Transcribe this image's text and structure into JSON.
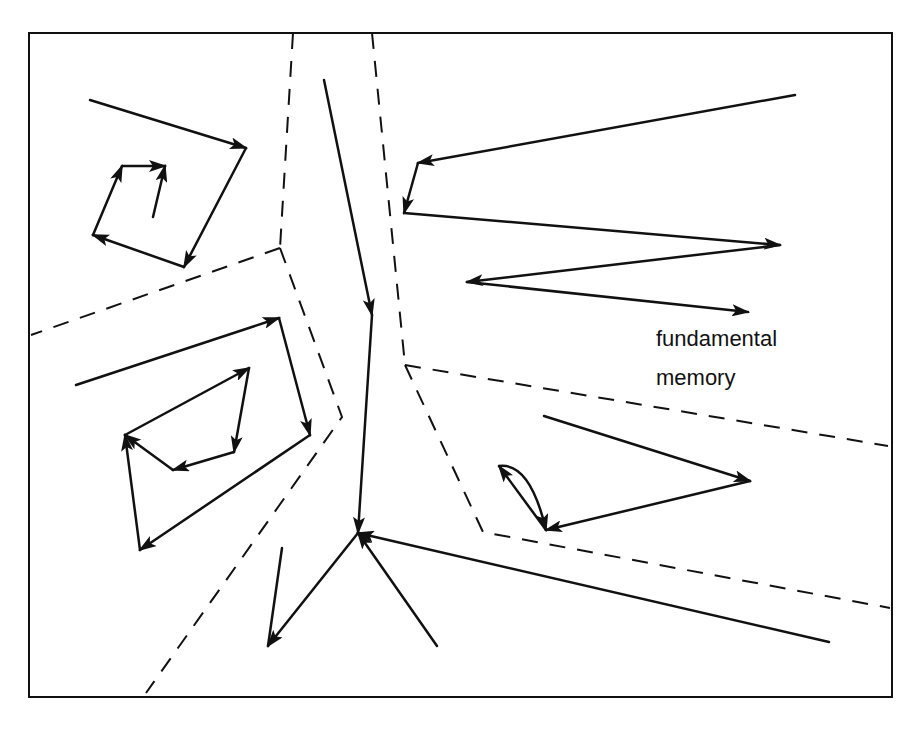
{
  "diagram": {
    "colors": {
      "ink": "#111111",
      "background": "#ffffff"
    },
    "frame": {
      "x1": 29,
      "y1": 33,
      "x2": 892,
      "y2": 697
    },
    "labels": [
      {
        "id": "label-fundamental",
        "text": "fundamental",
        "x": 656,
        "y": 326
      },
      {
        "id": "label-memory",
        "text": "memory",
        "x": 656,
        "y": 365
      }
    ],
    "basin_boundaries": [
      {
        "id": "boundary-left-vertical",
        "points": [
          [
            293,
            33
          ],
          [
            280,
            248
          ]
        ]
      },
      {
        "id": "boundary-left-upper-diagonal",
        "points": [
          [
            280,
            248
          ],
          [
            31,
            335
          ]
        ]
      },
      {
        "id": "boundary-left-lower",
        "points": [
          [
            280,
            248
          ],
          [
            342,
            417
          ],
          [
            146,
            693
          ]
        ]
      },
      {
        "id": "boundary-center-vertical",
        "points": [
          [
            372,
            33
          ],
          [
            405,
            365
          ]
        ]
      },
      {
        "id": "boundary-right-upper",
        "points": [
          [
            405,
            365
          ],
          [
            888,
            446
          ]
        ]
      },
      {
        "id": "boundary-right-lower",
        "points": [
          [
            405,
            365
          ],
          [
            483,
            532
          ],
          [
            890,
            608
          ]
        ]
      }
    ],
    "trajectories": [
      {
        "id": "spiral-outer",
        "points": [
          [
            90,
            100
          ],
          [
            246,
            148
          ],
          [
            184,
            267
          ],
          [
            93,
            235
          ],
          [
            122,
            166
          ],
          [
            165,
            166
          ]
        ],
        "arrows_at": [
          1,
          2,
          3,
          4,
          5
        ]
      },
      {
        "id": "spiral-inner",
        "points": [
          [
            153,
            217
          ],
          [
            165,
            166
          ]
        ],
        "arrows_at": [
          1
        ]
      },
      {
        "id": "loop-outer",
        "points": [
          [
            76,
            385
          ],
          [
            279,
            318
          ],
          [
            310,
            435
          ],
          [
            140,
            550
          ],
          [
            125,
            435
          ]
        ],
        "arrows_at": [
          1,
          2,
          3,
          4
        ]
      },
      {
        "id": "loop-inner",
        "points": [
          [
            125,
            435
          ],
          [
            249,
            368
          ],
          [
            234,
            452
          ],
          [
            173,
            470
          ],
          [
            125,
            435
          ]
        ],
        "arrows_at": [
          1,
          2,
          3,
          4
        ]
      },
      {
        "id": "center-descent",
        "points": [
          [
            324,
            80
          ],
          [
            372,
            315
          ],
          [
            358,
            533
          ]
        ],
        "arrows_at": [
          1,
          2
        ]
      },
      {
        "id": "center-from-right",
        "points": [
          [
            829,
            642
          ],
          [
            358,
            533
          ]
        ],
        "arrows_at": [
          1
        ]
      },
      {
        "id": "center-from-below",
        "points": [
          [
            437,
            646
          ],
          [
            358,
            533
          ]
        ],
        "arrows_at": [
          1
        ]
      },
      {
        "id": "center-to-lower-left",
        "points": [
          [
            358,
            533
          ],
          [
            268,
            646
          ]
        ],
        "arrows_at": [
          1
        ]
      },
      {
        "id": "short-down-left",
        "points": [
          [
            282,
            548
          ],
          [
            268,
            646
          ]
        ],
        "arrows_at": []
      },
      {
        "id": "zigzag-right",
        "points": [
          [
            795,
            95
          ],
          [
            418,
            163
          ],
          [
            404,
            213
          ],
          [
            780,
            245
          ],
          [
            467,
            282
          ],
          [
            748,
            312
          ]
        ],
        "arrows_at": [
          1,
          2,
          3,
          4,
          5
        ]
      },
      {
        "id": "lower-right-approach",
        "points": [
          [
            544,
            416
          ],
          [
            750,
            481
          ],
          [
            546,
            530
          ]
        ],
        "arrows_at": [
          1,
          2
        ]
      },
      {
        "id": "lower-right-oscillation-straight",
        "points": [
          [
            546,
            530
          ],
          [
            499,
            466
          ]
        ],
        "arrows_at": [
          1
        ]
      },
      {
        "id": "lower-right-oscillation-curve",
        "curve": "M499,466 Q530,462 546,530",
        "arrows_at_end": true
      }
    ]
  }
}
